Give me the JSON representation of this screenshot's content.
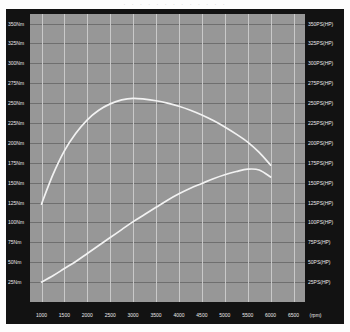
{
  "header": {
    "cropped_text": "· · · · · · · · · · · · ·"
  },
  "axes": {
    "left_unit": "Nm",
    "right_unit": "PS(HP)",
    "x_unit": "(rpm)"
  },
  "chart_data": {
    "type": "line",
    "title": "",
    "subtitle": "",
    "xlabel": "(rpm)",
    "ylabel": "Nm",
    "y2label": "PS(HP)",
    "grid": true,
    "legend": "none",
    "xlim": [
      750,
      6750
    ],
    "ylim": [
      0,
      362
    ],
    "y2lim": [
      0,
      362
    ],
    "x_ticks": [
      1000,
      1500,
      2000,
      2500,
      3000,
      3500,
      4000,
      4500,
      5000,
      5500,
      6000,
      6500
    ],
    "x_tick_labels": [
      "1000",
      "1500",
      "2000",
      "2500",
      "3000",
      "3500",
      "4000",
      "4500",
      "5000",
      "5500",
      "6000",
      "6500"
    ],
    "y_ticks": [
      25,
      50,
      75,
      100,
      125,
      150,
      175,
      200,
      225,
      250,
      275,
      300,
      325,
      350
    ],
    "y_tick_labels": [
      "25Nm",
      "50Nm",
      "75Nm",
      "100Nm",
      "125Nm",
      "150Nm",
      "175Nm",
      "200Nm",
      "225Nm",
      "250Nm",
      "275Nm",
      "300Nm",
      "325Nm",
      "350Nm"
    ],
    "y2_ticks": [
      25,
      50,
      75,
      100,
      125,
      150,
      175,
      200,
      225,
      250,
      275,
      300,
      325,
      350
    ],
    "y2_tick_labels": [
      "25PS(HP)",
      "50PS(HP)",
      "75PS(HP)",
      "100PS(HP)",
      "125PS(HP)",
      "150PS(HP)",
      "175PS(HP)",
      "200PS(HP)",
      "225PS(HP)",
      "250PS(HP)",
      "275PS(HP)",
      "300PS(HP)",
      "325PS(HP)",
      "350PS(HP)"
    ],
    "series": [
      {
        "name": "Torque",
        "axis": "left",
        "unit": "Nm",
        "color": "#f2f2f2",
        "x": [
          1000,
          1250,
          1500,
          1750,
          2000,
          2250,
          2500,
          2750,
          3000,
          3250,
          3500,
          3750,
          4000,
          4250,
          4500,
          4750,
          5000,
          5250,
          5500,
          5750,
          6000
        ],
        "values": [
          123,
          160,
          190,
          212,
          229,
          241,
          249,
          254,
          256,
          255,
          253,
          250,
          246,
          241,
          235,
          228,
          220,
          211,
          201,
          188,
          172
        ]
      },
      {
        "name": "Power",
        "axis": "right",
        "unit": "PS(HP)",
        "color": "#f2f2f2",
        "x": [
          1000,
          1250,
          1500,
          1750,
          2000,
          2250,
          2500,
          2750,
          3000,
          3250,
          3500,
          3750,
          4000,
          4250,
          4500,
          4750,
          5000,
          5250,
          5500,
          5750,
          6000
        ],
        "values": [
          25,
          33,
          42,
          51,
          61,
          71,
          81,
          91,
          101,
          110,
          119,
          128,
          136,
          143,
          149,
          155,
          160,
          164,
          167,
          166,
          157
        ]
      }
    ]
  }
}
